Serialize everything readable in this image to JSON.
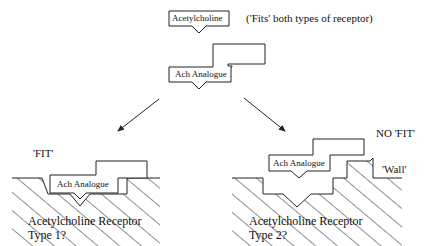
{
  "top": {
    "molecule_label": "Acetylcholine",
    "note": "('Fits' both types of receptor)"
  },
  "middle": {
    "analogue_label": "Ach Analogue"
  },
  "left": {
    "status": "'FIT'",
    "analogue_label": "Ach Analogue",
    "receptor_label": "Acetylcholine Receptor",
    "receptor_type": "Type 1?"
  },
  "right": {
    "status": "NO 'FIT'",
    "wall_label": "'Wall'",
    "analogue_label": "Ach Analogue",
    "receptor_label": "Acetylcholine Receptor",
    "receptor_type": "Type 2?"
  },
  "colors": {
    "line": "#222222",
    "background": "#ffffff"
  }
}
